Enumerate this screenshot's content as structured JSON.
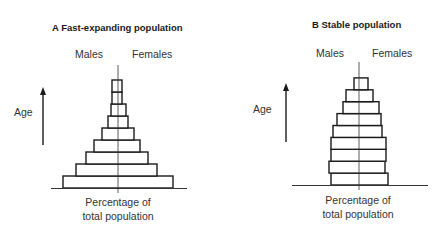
{
  "chart_data": [
    {
      "type": "bar",
      "subtype": "population-pyramid",
      "panel_letter": "A",
      "title": "A  Fast-expanding population",
      "left_label": "Males",
      "right_label": "Females",
      "ylabel": "Age",
      "xlabel": "Percentage of total population",
      "xlabel_lines": [
        "Percentage of",
        "total population"
      ],
      "age_groups_bottom_to_top": [
        "1",
        "2",
        "3",
        "4",
        "5",
        "6",
        "7",
        "8",
        "9"
      ],
      "series": [
        {
          "name": "Males",
          "values": [
            55,
            42,
            32,
            24,
            16,
            10,
            7,
            6,
            6
          ]
        },
        {
          "name": "Females",
          "values": [
            55,
            39,
            30,
            22,
            16,
            10,
            8,
            4,
            4
          ]
        }
      ],
      "geometry": {
        "center_x": 118,
        "baseline_y": 188,
        "bar_height": 12,
        "axis_top_y": 65,
        "baseline_x0": 51,
        "baseline_x1": 187,
        "arrow_x": 43,
        "arrow_top": 87,
        "arrow_bottom": 145
      },
      "grid": false,
      "legend": "none"
    },
    {
      "type": "bar",
      "subtype": "population-pyramid",
      "panel_letter": "B",
      "title": "B  Stable population",
      "left_label": "Males",
      "right_label": "Females",
      "ylabel": "Age",
      "xlabel": "Percentage of total population",
      "xlabel_lines": [
        "Percentage of",
        "total population"
      ],
      "age_groups_bottom_to_top": [
        "1",
        "2",
        "3",
        "4",
        "5",
        "6",
        "7",
        "8",
        "9"
      ],
      "series": [
        {
          "name": "Males",
          "values": [
            28,
            30,
            28,
            28,
            26,
            22,
            16,
            13,
            5
          ]
        },
        {
          "name": "Females",
          "values": [
            29,
            26,
            27,
            27,
            23,
            22,
            20,
            14,
            9
          ]
        }
      ],
      "geometry": {
        "center_x": 359,
        "baseline_y": 185,
        "bar_height": 11.9,
        "axis_top_y": 62,
        "baseline_x0": 292,
        "baseline_x1": 428,
        "arrow_x": 286,
        "arrow_top": 83,
        "arrow_bottom": 142
      },
      "grid": false,
      "legend": "none"
    }
  ],
  "panels": {
    "a": {
      "title": "A  Fast-expanding population",
      "males": "Males",
      "females": "Females",
      "age": "Age",
      "xlabel1": "Percentage of",
      "xlabel2": "total population"
    },
    "b": {
      "title": "B  Stable population",
      "males": "Males",
      "females": "Females",
      "age": "Age",
      "xlabel1": "Percentage of",
      "xlabel2": "total population"
    }
  },
  "colors": {
    "stroke": "#1a1a1a",
    "bar_fill": "#ffffff",
    "axis": "#333333"
  }
}
